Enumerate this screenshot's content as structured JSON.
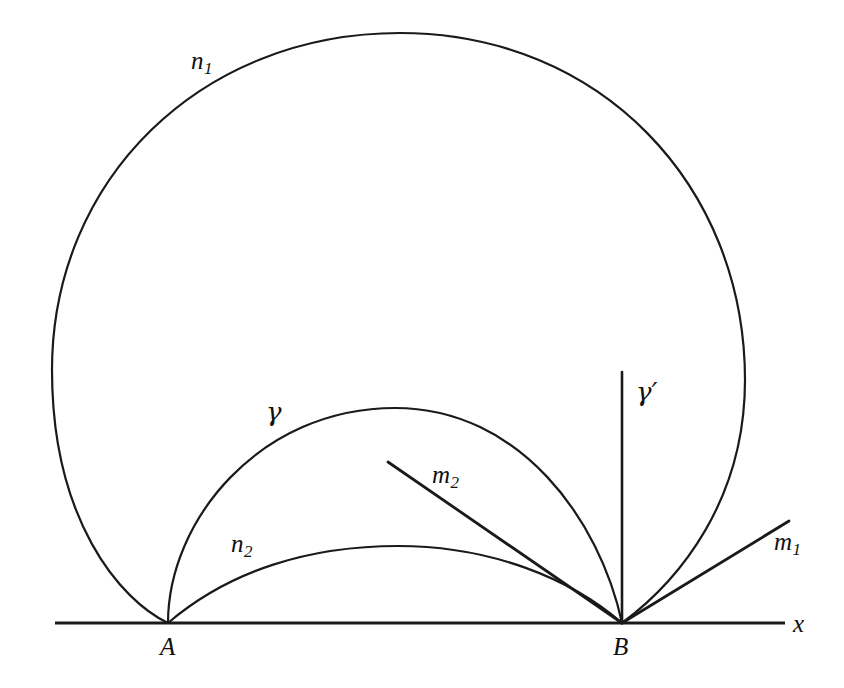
{
  "figure": {
    "kind": "geometry-diagram",
    "model": "upper-half-plane",
    "width": 844,
    "height": 688,
    "background_color": "#ffffff",
    "stroke_color": "#1a1a1a"
  },
  "axis": {
    "name": "x-axis",
    "label": "x",
    "y": 623,
    "x_start": 55,
    "x_end": 785,
    "label_x": 793,
    "label_y": 611,
    "stroke_width": 3.2
  },
  "points": [
    {
      "id": "A",
      "label": "A",
      "x": 168,
      "y": 623,
      "label_x": 160,
      "label_y": 634
    },
    {
      "id": "B",
      "label": "B",
      "x": 622,
      "y": 623,
      "label_x": 613,
      "label_y": 634
    }
  ],
  "curves": [
    {
      "id": "n1",
      "label": "n",
      "label_sub": "1",
      "type": "large-oval-through-A-and-B",
      "path": "M 168 623 C 120 600 52 520 52 370 C 52 180 200 33 400 33 C 600 33 745 185 745 380 C 745 500 680 580 622 623",
      "label_x": 191,
      "label_y": 48,
      "apex_x": 400,
      "apex_y": 33,
      "leftmost_x": 52,
      "leftmost_y": 370,
      "rightmost_x": 745,
      "rightmost_y": 380,
      "stroke_width": 2.2
    },
    {
      "id": "gamma",
      "label": "γ",
      "type": "geodesic-arc-A-to-B",
      "path": "M 168 623 C 168 520 260 408 395 408 C 520 408 600 520 622 623",
      "label_x": 266,
      "label_y": 399,
      "apex_x": 395,
      "apex_y": 408,
      "stroke_width": 2.2
    },
    {
      "id": "n2",
      "label": "n",
      "label_sub": "2",
      "type": "arc-A-to-B",
      "path": "M 168 623 C 230 570 310 546 398 546 C 490 546 570 578 622 623",
      "label_x": 231,
      "label_y": 531,
      "apex_x": 398,
      "apex_y": 546,
      "stroke_width": 2.2
    }
  ],
  "lines": [
    {
      "id": "gamma-prime",
      "label": "γ",
      "label_prime": "′",
      "type": "vertical-geodesic-at-B",
      "x1": 622,
      "y1": 372,
      "x2": 622,
      "y2": 623,
      "label_x": 636,
      "label_y": 379,
      "stroke_width": 2.6
    },
    {
      "id": "m2",
      "label": "m",
      "label_sub": "2",
      "type": "ray-into-B",
      "x1": 388,
      "y1": 462,
      "x2": 622,
      "y2": 623,
      "label_x": 432,
      "label_y": 462,
      "stroke_width": 2.8
    },
    {
      "id": "m1",
      "label": "m",
      "label_sub": "1",
      "type": "ray-from-B",
      "x1": 622,
      "y1": 623,
      "x2": 789,
      "y2": 521,
      "label_x": 774,
      "label_y": 529,
      "stroke_width": 2.8
    }
  ]
}
